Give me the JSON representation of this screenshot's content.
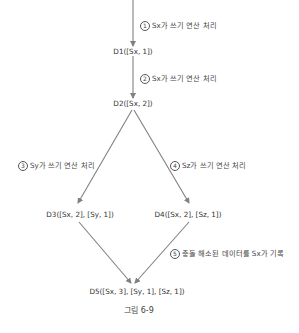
{
  "nodes": {
    "d1": "D1([Sx, 1])",
    "d2": "D2([Sx, 2])",
    "d3": "D3([Sx, 2], [Sy, 1])",
    "d4": "D4([Sx, 2], [Sz, 1])",
    "d5": "D5([Sx, 3], [Sy, 1], [Sz, 1])"
  },
  "edges": [
    {
      "num": "1",
      "text": "Sx가 쓰기 연산 처리"
    },
    {
      "num": "2",
      "text": "Sx가 쓰기 연산 처리"
    },
    {
      "num": "3",
      "text": "Sy가 쓰기 연산 처리"
    },
    {
      "num": "4",
      "text": "Sz가 쓰기 연산 처리"
    },
    {
      "num": "5",
      "text": "충돌 해소된 데이터를 Sx가 기록"
    }
  ],
  "caption": "그림 6-9",
  "colors": {
    "line": "#808080",
    "text": "#333333"
  }
}
